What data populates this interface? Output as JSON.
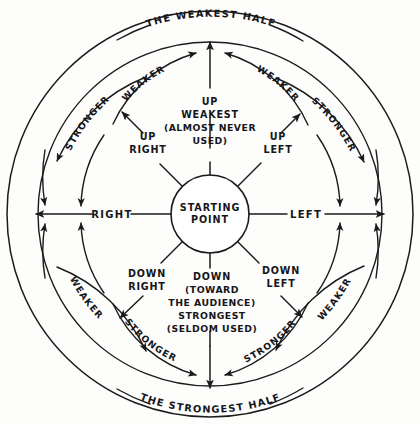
{
  "diagram": {
    "hub": {
      "line1": "STARTING",
      "line2": "POINT"
    },
    "halves": {
      "top": "THE WEAKEST HALF",
      "bottom": "THE STRONGEST HALF"
    },
    "axes": {
      "left_side_label": "RIGHT",
      "right_side_label": "LEFT"
    },
    "directions": {
      "up": {
        "line1": "UP",
        "line2": "WEAKEST",
        "line3": "(ALMOST NEVER",
        "line4": "USED)"
      },
      "up_right": {
        "line1": "UP",
        "line2": "RIGHT"
      },
      "up_left": {
        "line1": "UP",
        "line2": "LEFT"
      },
      "down_right": {
        "line1": "DOWN",
        "line2": "RIGHT"
      },
      "down_left": {
        "line1": "DOWN",
        "line2": "LEFT"
      },
      "down": {
        "line1": "DOWN",
        "line2": "(TOWARD",
        "line3": "THE AUDIENCE)",
        "line4": "STRONGEST",
        "line5": "(SELDOM USED)"
      }
    },
    "arc_labels": {
      "upper_left_inner": "WEAKER",
      "upper_left_outer": "STRONGER",
      "upper_right_inner": "WEAKER",
      "upper_right_outer": "STRONGER",
      "lower_left_inner": "STRONGER",
      "lower_left_outer": "WEAKER",
      "lower_right_inner": "STRONGER",
      "lower_right_outer": "WEAKER"
    },
    "colors": {
      "ink": "#1b1b1b",
      "paper": "#fdfdfc"
    }
  }
}
